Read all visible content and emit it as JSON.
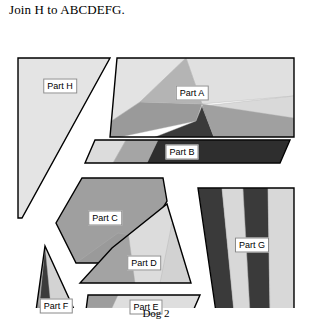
{
  "instruction": "Join H to ABCDEFG.",
  "caption": "Dog 2",
  "colors": {
    "outline": "#000000",
    "background": "#ffffff",
    "lightest": "#e3e3e3",
    "light": "#d5d5d5",
    "mid_light": "#c9c9c9",
    "mid": "#a8a8a8",
    "mid_dark": "#8c8c8c",
    "dark": "#555555",
    "darkest": "#333333",
    "label_border": "#8a8a8a"
  },
  "parts": [
    {
      "id": "A",
      "label": "Part A",
      "label_x": 192,
      "label_y": 75,
      "outline": "117,40 294,40 294,119 110,119",
      "facets": [
        {
          "name": "a-upper-left-light",
          "points": "117,40 186,40 140,84 110,104 110,119 110,119",
          "fill": "#e3e3e3"
        },
        {
          "name": "a-upper-right-light",
          "points": "186,40 294,40 294,78 202,86",
          "fill": "#e0e0e0"
        },
        {
          "name": "a-right-pale",
          "points": "294,78 294,119 214,119 202,88",
          "fill": "#d9d9d9"
        },
        {
          "name": "a-left-mid",
          "points": "140,84 202,86 196,103 120,119 110,119 110,104",
          "fill": "#9a9a9a"
        },
        {
          "name": "a-left-midgray",
          "points": "186,40 202,86 140,84",
          "fill": "#b4b4b4"
        },
        {
          "name": "a-center-dark",
          "points": "196,103 202,88 214,119 155,119",
          "fill": "#3a3a3a"
        },
        {
          "name": "a-center-shadow",
          "points": "202,88 224,112 214,119",
          "fill": "#777777"
        },
        {
          "name": "a-lower-right-mid",
          "points": "202,86 294,100 294,119 214,119",
          "fill": "#a0a0a0"
        }
      ]
    },
    {
      "id": "B",
      "label": "Part B",
      "label_x": 182,
      "label_y": 134,
      "outline": "95,122 290,122 280,145 85,145",
      "facets": [
        {
          "name": "b-left-light",
          "points": "95,122 126,122 113,145 85,145",
          "fill": "#dcdcdc"
        },
        {
          "name": "b-left-mid",
          "points": "126,122 158,122 147,145 113,145",
          "fill": "#a5a5a5"
        },
        {
          "name": "b-dark-body",
          "points": "158,122 290,122 280,145 147,145",
          "fill": "#2e2e2e"
        }
      ]
    },
    {
      "id": "C",
      "label": "Part C",
      "label_x": 105,
      "label_y": 200,
      "outline": "82,160 163,160 167,183 145,219 108,245 76,245 56,205",
      "facets": [
        {
          "name": "c-body",
          "points": "82,160 163,160 167,183 145,219 108,245 76,245 56,205",
          "fill": "#9f9f9f"
        },
        {
          "name": "c-lower-mid",
          "points": "118,215 145,219 108,245 76,245",
          "fill": "#9a9a9a"
        }
      ]
    },
    {
      "id": "D",
      "label": "Part D",
      "label_x": 144,
      "label_y": 245,
      "outline": "167,186 191,265 80,265 112,230",
      "facets": [
        {
          "name": "d-body",
          "points": "167,186 191,265 80,265 112,230",
          "fill": "#dcdcdc"
        },
        {
          "name": "d-left-mid",
          "points": "128,213 135,265 80,265 112,230",
          "fill": "#a3a3a3"
        },
        {
          "name": "d-right-pale",
          "points": "172,205 191,265 160,265",
          "fill": "#d2d2d2"
        }
      ]
    },
    {
      "id": "E",
      "label": "Part E",
      "label_x": 146,
      "label_y": 289,
      "outline": "88,277 200,277 190,300 85,300",
      "facets": [
        {
          "name": "e-body",
          "points": "88,277 200,277 190,300 85,300",
          "fill": "#dedede"
        },
        {
          "name": "e-left-mid",
          "points": "88,277 118,277 112,290 85,290",
          "fill": "#9d9d9d"
        },
        {
          "name": "e-left-light",
          "points": "85,290 112,290 110,300 85,300",
          "fill": "#c4c4c4"
        }
      ]
    },
    {
      "id": "F",
      "label": "Part F",
      "label_x": 56,
      "label_y": 288,
      "outline": "45,228 78,300 35,300",
      "facets": [
        {
          "name": "f-body",
          "points": "45,228 78,300 35,300",
          "fill": "#d3d3d3"
        },
        {
          "name": "f-dark-wedge",
          "points": "45,228 52,300 38,300",
          "fill": "#3c3c3c"
        },
        {
          "name": "f-mid-wedge",
          "points": "45,228 38,300 35,300",
          "fill": "#9b9b9b"
        }
      ]
    },
    {
      "id": "G",
      "label": "Part G",
      "label_x": 252,
      "label_y": 227,
      "outline": "198,170 294,170 294,294 216,294",
      "facets": [
        {
          "name": "g-stripe-1-dark",
          "points": "198,170 222,170 234,294 216,294",
          "fill": "#3a3a3a"
        },
        {
          "name": "g-stripe-2-light",
          "points": "222,170 243,170 250,294 234,294",
          "fill": "#d8d8d8"
        },
        {
          "name": "g-stripe-3-dark",
          "points": "243,170 268,170 270,294 250,294",
          "fill": "#3a3a3a"
        },
        {
          "name": "g-stripe-4-light",
          "points": "268,170 294,170 294,294 270,294",
          "fill": "#d8d8d8"
        }
      ]
    },
    {
      "id": "H",
      "label": "Part H",
      "label_x": 60,
      "label_y": 68,
      "outline": "18,40 110,40 22,200 18,200",
      "facets": [
        {
          "name": "h-body",
          "points": "18,40 110,40 22,200 18,200",
          "fill": "#e4e4e4"
        }
      ]
    }
  ]
}
